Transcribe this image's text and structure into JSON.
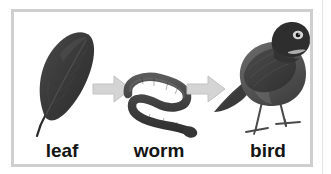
{
  "figure": {
    "type": "food-chain-diagram",
    "caption_labels": [
      "leaf",
      "worm",
      "bird"
    ],
    "stages": [
      {
        "id": "leaf",
        "label": "leaf",
        "icon": "leaf-illustration"
      },
      {
        "id": "worm",
        "label": "worm",
        "icon": "worm-illustration"
      },
      {
        "id": "bird",
        "label": "bird",
        "icon": "bird-illustration"
      }
    ],
    "connectors": [
      {
        "id": "arrow-1",
        "icon": "right-arrow-icon",
        "from": "leaf",
        "to": "worm"
      },
      {
        "id": "arrow-2",
        "icon": "right-arrow-icon",
        "from": "worm",
        "to": "bird"
      }
    ],
    "colors": {
      "frame_border": "#cfcfcf",
      "canvas_background": "#ffffff",
      "arrow_fill": "#d4d4d4",
      "arrow_stroke": "#bdbdbd",
      "label_text": "#141414",
      "leaf_dark": "#3a3a3a",
      "worm_dark": "#4a4a4a",
      "bird_dark": "#404040"
    }
  }
}
